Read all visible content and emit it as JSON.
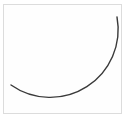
{
  "figure": {
    "frame_border_color": "#dcdcdc",
    "arc": {
      "stroke_color": "#3a3a3a",
      "stroke_width": 1.4,
      "start": [
        117,
        17
      ],
      "end": [
        11,
        85
      ],
      "radius": 68
    }
  }
}
